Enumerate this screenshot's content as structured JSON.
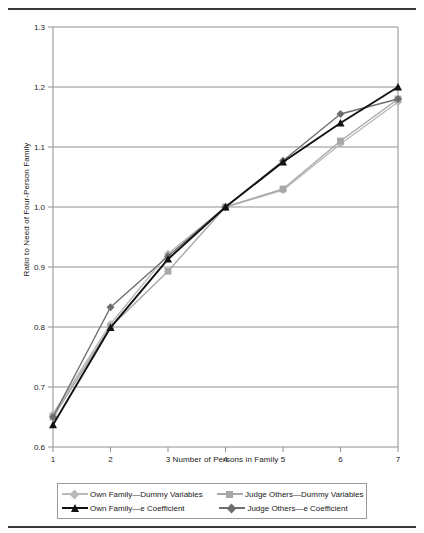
{
  "chart_data": {
    "type": "line",
    "title": "",
    "xlabel": "Number of Persons in Family",
    "ylabel": "Ratio to Need of Four-Person Family",
    "x": [
      1,
      2,
      3,
      4,
      5,
      6,
      7
    ],
    "xlim": [
      1,
      7
    ],
    "ylim": [
      0.6,
      1.3
    ],
    "xticks": [
      "1",
      "2",
      "3",
      "4",
      "5",
      "6",
      "7"
    ],
    "yticks": [
      "0.6",
      "0.7",
      "0.8",
      "0.9",
      "1.0",
      "1.1",
      "1.2",
      "1.3"
    ],
    "grid": "horizontal",
    "legend_position": "bottom",
    "series": [
      {
        "name": "Own Family—Dummy Variables",
        "color": "#b9b9b9",
        "marker": "diamond",
        "values": [
          0.655,
          0.805,
          0.922,
          1.0,
          1.028,
          1.105,
          1.175
        ]
      },
      {
        "name": "Judge Others—Dummy Variables",
        "color": "#a8a8a8",
        "marker": "square",
        "values": [
          0.65,
          0.8,
          0.893,
          1.0,
          1.03,
          1.11,
          1.18
        ]
      },
      {
        "name": "Own Family—e Coefficient",
        "color": "#111111",
        "marker": "triangle",
        "values": [
          0.637,
          0.799,
          0.913,
          1.0,
          1.075,
          1.14,
          1.2
        ]
      },
      {
        "name": "Judge Others—e Coefficient",
        "color": "#6e6e6e",
        "marker": "diamond",
        "values": [
          0.65,
          0.833,
          0.918,
          1.0,
          1.077,
          1.155,
          1.18
        ]
      }
    ]
  },
  "legend": {
    "rows": [
      [
        {
          "label": "Own Family—Dummy Variables",
          "color": "#b9b9b9",
          "marker": "diamond"
        },
        {
          "label": "Judge Others—Dummy Variables",
          "color": "#a8a8a8",
          "marker": "square"
        }
      ],
      [
        {
          "label": "Own Family—e Coefficient",
          "color": "#111111",
          "marker": "triangle"
        },
        {
          "label": "Judge Others—e Coefficient",
          "color": "#6e6e6e",
          "marker": "diamond"
        }
      ]
    ]
  },
  "colors": {
    "gridline": "#8f8f8f",
    "frame": "#8f8f8f",
    "rule": "#3a3a3a",
    "text": "#1a1a1a"
  }
}
